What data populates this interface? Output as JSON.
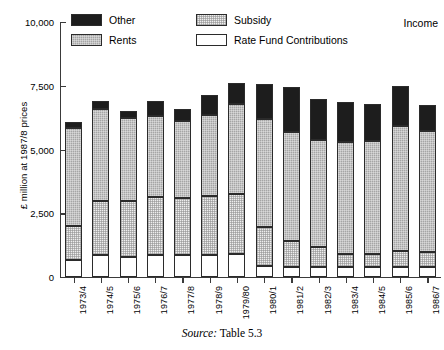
{
  "corner_label": "Income",
  "source": {
    "prefix": "Source:",
    "text": "Table 5.3"
  },
  "legend": {
    "items": [
      {
        "label": "Other",
        "key": "other",
        "color": "#1d1d1d"
      },
      {
        "label": "Rents",
        "key": "rents",
        "color": "#a5a5a5"
      },
      {
        "label": "Subsidy",
        "key": "subsidy",
        "color": "#eeeeee"
      },
      {
        "label": "Rate Fund Contributions",
        "key": "rfc",
        "color": "#ffffff"
      }
    ]
  },
  "axes": {
    "y_title": "£ million at 1987/8 prices",
    "y_ticks": [
      "0",
      "2,500",
      "5,000",
      "7,500",
      "10,000"
    ],
    "y_tick_values": [
      0,
      2500,
      5000,
      7500,
      10000
    ],
    "x_labels": [
      "1973/4",
      "1974/5",
      "1975/6",
      "1976/7",
      "1977/8",
      "1978/9",
      "1979/80",
      "1980/1",
      "1981/2",
      "1982/3",
      "1983/4",
      "1984/5",
      "1985/6",
      "1986/7"
    ]
  },
  "chart_data": {
    "type": "bar",
    "stacked": true,
    "title": "Income",
    "xlabel": "",
    "ylabel": "£ million at 1987/8 prices",
    "ylim": [
      0,
      10000
    ],
    "grid": false,
    "legend_position": "top-left",
    "categories": [
      "1973/4",
      "1974/5",
      "1975/6",
      "1976/7",
      "1977/8",
      "1978/9",
      "1979/80",
      "1980/1",
      "1981/2",
      "1982/3",
      "1983/4",
      "1984/5",
      "1985/6",
      "1986/7"
    ],
    "series": [
      {
        "name": "Rate Fund Contributions",
        "key": "rfc",
        "color": "#ffffff",
        "values": [
          650,
          850,
          800,
          850,
          850,
          880,
          900,
          450,
          400,
          400,
          380,
          400,
          380,
          380
        ]
      },
      {
        "name": "Subsidy",
        "key": "subsidy",
        "color": "#eeeeee",
        "values": [
          1350,
          2150,
          2200,
          2300,
          2250,
          2280,
          2350,
          1500,
          1000,
          780,
          520,
          520,
          630,
          600
        ]
      },
      {
        "name": "Rents",
        "key": "rents",
        "color": "#a5a5a5",
        "values": [
          3850,
          3600,
          3250,
          3150,
          3000,
          3200,
          3550,
          4250,
          4300,
          4200,
          4400,
          4400,
          4900,
          4750
        ]
      },
      {
        "name": "Other",
        "key": "other",
        "color": "#1d1d1d",
        "values": [
          230,
          320,
          270,
          600,
          470,
          790,
          800,
          1350,
          1750,
          1600,
          1550,
          1450,
          1600,
          1000
        ]
      }
    ],
    "totals": [
      6080,
      6920,
      6520,
      6900,
      6570,
      7150,
      7600,
      7550,
      7450,
      6980,
      6850,
      6770,
      7510,
      6730
    ]
  }
}
